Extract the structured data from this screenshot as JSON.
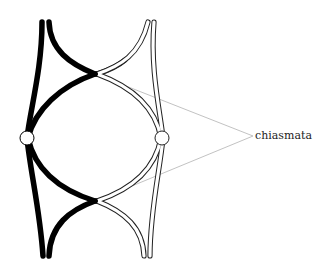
{
  "diagram": {
    "annotation": {
      "label": "chiasmata",
      "anchor": [
        253,
        136
      ],
      "targets": [
        [
          97,
          74
        ],
        [
          97,
          201
        ]
      ]
    },
    "chromosomes": [
      {
        "name": "left-homolog",
        "color": "#000000",
        "fill": "#000000",
        "centromere": [
          27,
          138
        ]
      },
      {
        "name": "right-homolog",
        "color": "#222222",
        "fill": "#ffffff",
        "centromere": [
          162,
          138
        ]
      }
    ],
    "chiasmata": [
      {
        "name": "upper-chiasma",
        "position": [
          95,
          74
        ]
      },
      {
        "name": "lower-chiasma",
        "position": [
          95,
          201
        ]
      }
    ],
    "colors": {
      "leader_line": "#bbbbbb",
      "black_chromatid": "#000000",
      "white_chromatid_outline": "#222222"
    }
  }
}
